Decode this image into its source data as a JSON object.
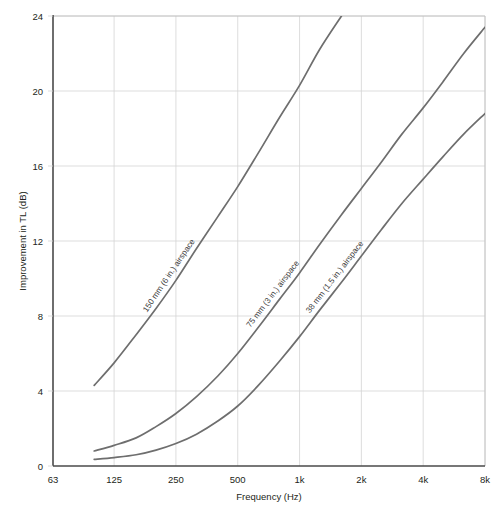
{
  "chart_data": {
    "type": "line",
    "title": "",
    "xlabel": "Frequency (Hz)",
    "ylabel": "Improvement in TL (dB)",
    "x_tick_labels": [
      "63",
      "125",
      "250",
      "500",
      "1k",
      "2k",
      "4k",
      "8k"
    ],
    "x_tick_values": [
      63,
      125,
      250,
      500,
      1000,
      2000,
      4000,
      8000
    ],
    "x_scale": "log-octave",
    "xlim": [
      63,
      8000
    ],
    "y_tick_labels": [
      "0",
      "4",
      "8",
      "12",
      "16",
      "20",
      "24"
    ],
    "y_tick_values": [
      0,
      4,
      8,
      12,
      16,
      20,
      24
    ],
    "ylim": [
      0,
      24
    ],
    "grid": true,
    "legend": "inline-curve-labels",
    "line_color": "#6e6e6e",
    "grid_color": "#d4d4d4",
    "axis_color": "#4a4a4a",
    "series": [
      {
        "name": "150 mm (6 in.) airspace",
        "label": "150 mm (6 in.) airspace",
        "x": [
          100,
          125,
          160,
          200,
          250,
          315,
          400,
          500,
          630,
          800,
          1000,
          1250,
          1600
        ],
        "values": [
          4.3,
          5.5,
          7.0,
          8.4,
          9.9,
          11.6,
          13.3,
          14.9,
          16.7,
          18.6,
          20.3,
          22.2,
          24.0
        ]
      },
      {
        "name": "75 mm (3 in.) airspace",
        "label": "75 mm (3 in.) airspace",
        "x": [
          100,
          125,
          160,
          200,
          250,
          315,
          400,
          500,
          630,
          800,
          1000,
          1250,
          1600,
          2000,
          2500,
          3150,
          4000,
          5000,
          6300,
          8000
        ],
        "values": [
          0.8,
          1.1,
          1.5,
          2.1,
          2.8,
          3.7,
          4.8,
          6.0,
          7.4,
          8.9,
          10.3,
          11.8,
          13.4,
          14.8,
          16.2,
          17.7,
          19.1,
          20.5,
          22.0,
          23.4
        ]
      },
      {
        "name": "38 mm (1.5 in.) airspace",
        "label": "38 mm (1.5 in.) airspace",
        "x": [
          100,
          125,
          160,
          200,
          250,
          315,
          400,
          500,
          630,
          800,
          1000,
          1250,
          1600,
          2000,
          2500,
          3150,
          4000,
          5000,
          6300,
          8000
        ],
        "values": [
          0.35,
          0.45,
          0.6,
          0.85,
          1.2,
          1.7,
          2.4,
          3.2,
          4.3,
          5.6,
          6.9,
          8.3,
          9.8,
          11.2,
          12.6,
          14.0,
          15.3,
          16.5,
          17.7,
          18.8
        ]
      }
    ]
  },
  "labels": {
    "y_axis_title": "Improvement in TL (dB)",
    "x_axis_title": "Frequency (Hz)"
  }
}
